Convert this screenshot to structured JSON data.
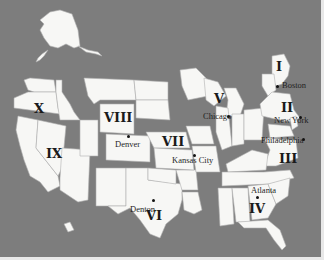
{
  "map": {
    "title": "U.S. Federal Regions",
    "background_color": "#7d7d7d",
    "land_color": "#f7f7f5",
    "regions": [
      {
        "id": "I",
        "label": "I"
      },
      {
        "id": "II",
        "label": "II"
      },
      {
        "id": "III",
        "label": "III"
      },
      {
        "id": "IV",
        "label": "IV"
      },
      {
        "id": "V",
        "label": "V"
      },
      {
        "id": "VI",
        "label": "VI"
      },
      {
        "id": "VII",
        "label": "VII"
      },
      {
        "id": "VIII",
        "label": "VIII"
      },
      {
        "id": "IX",
        "label": "IX"
      },
      {
        "id": "X",
        "label": "X"
      }
    ],
    "cities": [
      {
        "name": "Boston",
        "region": "I"
      },
      {
        "name": "New York",
        "region": "II"
      },
      {
        "name": "Philadelphia",
        "region": "III"
      },
      {
        "name": "Atlanta",
        "region": "IV"
      },
      {
        "name": "Chicago",
        "region": "V"
      },
      {
        "name": "Denton",
        "region": "VI"
      },
      {
        "name": "Kansas City",
        "region": "VII"
      },
      {
        "name": "Denver",
        "region": "VIII"
      }
    ]
  }
}
